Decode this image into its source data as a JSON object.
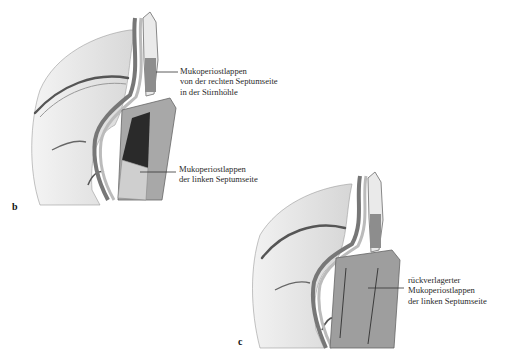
{
  "figure": {
    "panels": [
      {
        "id": "b",
        "letter": "b",
        "labels": [
          {
            "lines": [
              "Mukoperiostlappen",
              "von der rechten Septumseite",
              "in der Stirnhöhle"
            ]
          },
          {
            "lines": [
              "Mukoperiostlappen",
              "der linken Septumseite"
            ]
          }
        ]
      },
      {
        "id": "c",
        "letter": "c",
        "labels": [
          {
            "lines": [
              "rückverlagerter",
              "Mukoperiostlappen",
              "der linken Septumseite"
            ]
          }
        ]
      }
    ]
  }
}
